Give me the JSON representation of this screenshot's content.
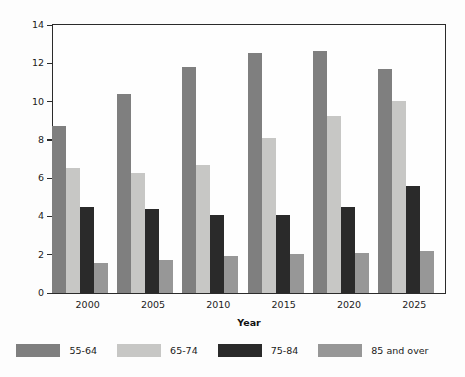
{
  "chart_data": {
    "type": "bar",
    "title": "",
    "xlabel": "Year",
    "ylabel": "Percent of Population",
    "categories": [
      "2000",
      "2005",
      "2010",
      "2015",
      "2020",
      "2025"
    ],
    "ylim": [
      0,
      14
    ],
    "yticks": [
      0,
      2,
      4,
      6,
      8,
      10,
      12,
      14
    ],
    "ytick_labels": [
      "0",
      "2",
      "4",
      "6",
      "8",
      "10",
      "12",
      "14"
    ],
    "grid": false,
    "legend_position": "bottom",
    "series": [
      {
        "name": "55-64",
        "color": "#7f7f7f",
        "values": [
          8.7,
          10.4,
          11.8,
          12.55,
          12.65,
          11.7
        ]
      },
      {
        "name": "65-74",
        "color": "#c7c7c5",
        "values": [
          6.55,
          6.25,
          6.7,
          8.1,
          9.25,
          10.05
        ]
      },
      {
        "name": "75-84",
        "color": "#2a2a2a",
        "values": [
          4.5,
          4.4,
          4.1,
          4.1,
          4.5,
          5.6
        ]
      },
      {
        "name": "85 and over",
        "color": "#979797",
        "values": [
          1.55,
          1.7,
          1.95,
          2.05,
          2.1,
          2.2
        ]
      }
    ]
  },
  "legend": {
    "items": [
      {
        "label": "55-64",
        "color": "#7f7f7f"
      },
      {
        "label": "65-74",
        "color": "#c7c7c5"
      },
      {
        "label": "75-84",
        "color": "#2a2a2a"
      },
      {
        "label": "85 and over",
        "color": "#979797"
      }
    ]
  },
  "axes": {
    "x_title": "Year",
    "y_title": "Percent of Population"
  }
}
